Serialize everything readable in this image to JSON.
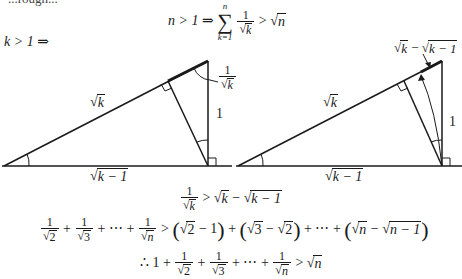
{
  "header_fragment": "...rough...",
  "theorem": {
    "lhs": "n > 1 ⇒",
    "sum_upper": "n",
    "sum_lower": "k=1",
    "sum_symbol": "∑",
    "summand_num": "1",
    "summand_den": "k",
    "relation": ">",
    "rhs_sqrt_arg": "n"
  },
  "premise": "k > 1 ⇒",
  "diagram_left": {
    "hyp_label": "k",
    "base_label": "k − 1",
    "side_label": "1",
    "segment_label_num": "1",
    "segment_label_den": "k"
  },
  "diagram_right": {
    "hyp_label": "k",
    "base_label": "k − 1",
    "side_label": "1",
    "segment_label_a": "k",
    "segment_label_minus": "−",
    "segment_label_b": "k − 1"
  },
  "inequality1": {
    "num": "1",
    "den": "k",
    "rel": ">",
    "a": "k",
    "minus": "−",
    "b": "k − 1"
  },
  "inequality2": {
    "t1_den": "2",
    "t2_den": "3",
    "tn_den": "n",
    "plus": "+",
    "dots": "+ ⋯ +",
    "rel": ">",
    "p1_a": "2",
    "p1_b": "1",
    "p2_a": "3",
    "p2_b": "2",
    "pn_a": "n",
    "pn_b": "n − 1"
  },
  "conclusion": {
    "therefore": "∴ 1 +",
    "t1_den": "2",
    "t2_den": "3",
    "tn_den": "n",
    "rel": ">",
    "rhs": "n"
  }
}
